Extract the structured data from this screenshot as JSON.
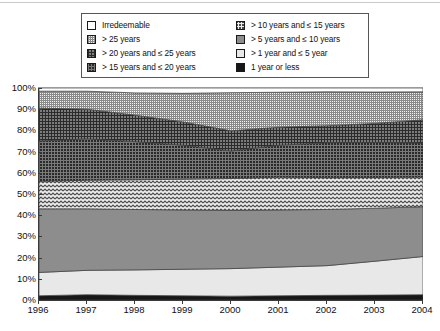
{
  "legend": {
    "left_column": [
      {
        "key": "irredeemable",
        "label": "Irredeemable",
        "swatch": "p-irredeemable"
      },
      {
        "key": "over_25",
        "label": "> 25 years",
        "swatch": "p-over25"
      },
      {
        "key": "y20_25",
        "label": "> 20 years and ≤ 25 years",
        "swatch": "p-20to25"
      },
      {
        "key": "y15_20",
        "label": "> 15 years and ≤ 20 years",
        "swatch": "p-15to20"
      }
    ],
    "right_column": [
      {
        "key": "y10_15",
        "label": "> 10 years and ≤ 15 years",
        "swatch": "p-10to15"
      },
      {
        "key": "y5_10",
        "label": "> 5 years and ≤ 10 years",
        "swatch": "p-5to10"
      },
      {
        "key": "y1_5",
        "label": "> 1 year and ≤ 5 year",
        "swatch": "p-1to5"
      },
      {
        "key": "y1_or_less",
        "label": "1 year or less",
        "swatch": "p-1orless"
      }
    ]
  },
  "chart_data": {
    "type": "area",
    "stacked": true,
    "title": "",
    "xlabel": "",
    "ylabel": "",
    "x": [
      1996,
      1997,
      1998,
      1999,
      2000,
      2001,
      2002,
      2003,
      2004
    ],
    "categories": [
      "1996",
      "1997",
      "1998",
      "1999",
      "2000",
      "2001",
      "2002",
      "2003",
      "2004"
    ],
    "ylim": [
      0,
      100
    ],
    "ytick_labels": [
      "0%",
      "10%",
      "20%",
      "30%",
      "40%",
      "50%",
      "60%",
      "70%",
      "80%",
      "90%",
      "100%"
    ],
    "ytick_values": [
      0,
      10,
      20,
      30,
      40,
      50,
      60,
      70,
      80,
      90,
      100
    ],
    "xtick_labels": [
      "1996",
      "1997",
      "1998",
      "1999",
      "2000",
      "2001",
      "2002",
      "2003",
      "2004"
    ],
    "grid": false,
    "legend_position": "top",
    "series": [
      {
        "name": "1 year or less",
        "key": "y1_or_less",
        "swatch": "p-1orless",
        "values": [
          2.0,
          2.5,
          2.2,
          2.0,
          1.8,
          2.0,
          2.2,
          2.3,
          2.5
        ]
      },
      {
        "name": "> 1 year and ≤ 5 year",
        "key": "y1_5",
        "swatch": "p-1to5",
        "values": [
          11.0,
          11.5,
          12.0,
          12.5,
          13.0,
          13.5,
          14.0,
          16.0,
          18.0
        ]
      },
      {
        "name": "> 5 years and ≤ 10 years",
        "key": "y5_10",
        "swatch": "p-5to10",
        "values": [
          30.0,
          29.0,
          28.5,
          28.0,
          27.5,
          27.0,
          26.5,
          25.0,
          23.5
        ]
      },
      {
        "name": "> 10 years and ≤ 15 years",
        "key": "y10_15",
        "swatch": "p-10to15",
        "values": [
          13.0,
          13.5,
          14.0,
          14.5,
          15.0,
          15.5,
          15.0,
          14.5,
          14.0
        ]
      },
      {
        "name": "> 15 years and ≤ 20 years",
        "key": "y15_20",
        "swatch": "p-15to20",
        "values": [
          19.0,
          19.5,
          18.0,
          16.0,
          13.0,
          15.0,
          16.5,
          16.5,
          16.0
        ]
      },
      {
        "name": "> 20 years and ≤ 25 years",
        "key": "y20_25",
        "swatch": "p-20to25",
        "values": [
          15.5,
          14.0,
          12.5,
          11.0,
          9.5,
          8.5,
          8.0,
          9.0,
          11.0
        ]
      },
      {
        "name": "> 25 years",
        "key": "over_25",
        "swatch": "p-over25",
        "values": [
          8.0,
          8.5,
          10.5,
          13.5,
          18.0,
          16.5,
          16.0,
          14.8,
          13.2
        ]
      },
      {
        "name": "Irredeemable",
        "key": "irredeemable",
        "swatch": "p-irredeemable",
        "values": [
          1.5,
          1.5,
          2.3,
          2.5,
          2.2,
          2.0,
          1.8,
          1.9,
          1.8
        ]
      }
    ]
  }
}
